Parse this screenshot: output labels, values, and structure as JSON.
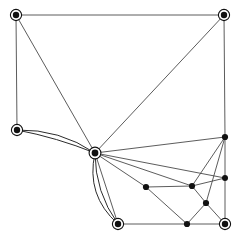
{
  "figure": {
    "kind": "graph-drawing",
    "title": "",
    "background_color": "#ffffff",
    "width": 240,
    "height": 238
  },
  "style": {
    "edge_color": "#4a4a4a",
    "curved_edge_color": "#2b2b2b",
    "node_fill": "#111111",
    "node_ring_stroke": "#111111",
    "node_ring_fill": "#ffffff",
    "edge_width": 0.9,
    "curved_edge_width": 1.0
  },
  "chart_data": {
    "type": "scatter",
    "title": "",
    "xlabel": "",
    "ylabel": "",
    "xlim": [
      0,
      240
    ],
    "ylim": [
      0,
      238
    ],
    "grid": false,
    "legend": "none",
    "nodes": [
      {
        "id": "n0",
        "label": "",
        "x": 16,
        "y": 15,
        "marker": "ringed",
        "radius": 3.2,
        "ring_radius": 5.6
      },
      {
        "id": "n1",
        "label": "",
        "x": 224,
        "y": 15,
        "marker": "ringed",
        "radius": 3.2,
        "ring_radius": 5.6
      },
      {
        "id": "n2",
        "label": "",
        "x": 17,
        "y": 130,
        "marker": "ringed",
        "radius": 3.2,
        "ring_radius": 5.6
      },
      {
        "id": "n3",
        "label": "",
        "x": 95,
        "y": 153,
        "marker": "ringed",
        "radius": 3.4,
        "ring_radius": 5.9
      },
      {
        "id": "n4",
        "label": "",
        "x": 225,
        "y": 137,
        "marker": "plain",
        "radius": 3.1,
        "ring_radius": 0
      },
      {
        "id": "n5",
        "label": "",
        "x": 225,
        "y": 178,
        "marker": "plain",
        "radius": 3.0,
        "ring_radius": 0
      },
      {
        "id": "n6",
        "label": "",
        "x": 146,
        "y": 187,
        "marker": "plain",
        "radius": 3.1,
        "ring_radius": 0
      },
      {
        "id": "n7",
        "label": "",
        "x": 192,
        "y": 186,
        "marker": "plain",
        "radius": 3.1,
        "ring_radius": 0
      },
      {
        "id": "n8",
        "label": "",
        "x": 206,
        "y": 203,
        "marker": "plain",
        "radius": 3.1,
        "ring_radius": 0
      },
      {
        "id": "n9",
        "label": "",
        "x": 118,
        "y": 224,
        "marker": "ringed",
        "radius": 3.2,
        "ring_radius": 5.6
      },
      {
        "id": "n10",
        "label": "",
        "x": 187,
        "y": 224,
        "marker": "plain",
        "radius": 3.1,
        "ring_radius": 0
      },
      {
        "id": "n11",
        "label": "",
        "x": 225,
        "y": 224,
        "marker": "ringed",
        "radius": 3.2,
        "ring_radius": 5.6
      }
    ],
    "edges": [
      {
        "from": "n0",
        "to": "n1",
        "curved": false,
        "bulge": 0
      },
      {
        "from": "n0",
        "to": "n2",
        "curved": false,
        "bulge": 0
      },
      {
        "from": "n0",
        "to": "n3",
        "curved": false,
        "bulge": 0
      },
      {
        "from": "n1",
        "to": "n3",
        "curved": false,
        "bulge": 0
      },
      {
        "from": "n1",
        "to": "n4",
        "curved": false,
        "bulge": 0
      },
      {
        "from": "n2",
        "to": "n3",
        "curved": true,
        "bulge": -13
      },
      {
        "from": "n2",
        "to": "n3",
        "curved": true,
        "bulge": -4
      },
      {
        "from": "n3",
        "to": "n4",
        "curved": false,
        "bulge": 0
      },
      {
        "from": "n3",
        "to": "n5",
        "curved": false,
        "bulge": 0
      },
      {
        "from": "n3",
        "to": "n6",
        "curved": false,
        "bulge": 0
      },
      {
        "from": "n3",
        "to": "n7",
        "curved": false,
        "bulge": 0
      },
      {
        "from": "n3",
        "to": "n9",
        "curved": false,
        "bulge": 0
      },
      {
        "from": "n3",
        "to": "n9",
        "curved": true,
        "bulge": 12
      },
      {
        "from": "n3",
        "to": "n9",
        "curved": true,
        "bulge": 22
      },
      {
        "from": "n4",
        "to": "n5",
        "curved": false,
        "bulge": 0
      },
      {
        "from": "n4",
        "to": "n7",
        "curved": false,
        "bulge": 0
      },
      {
        "from": "n4",
        "to": "n8",
        "curved": false,
        "bulge": 0
      },
      {
        "from": "n5",
        "to": "n7",
        "curved": false,
        "bulge": 0
      },
      {
        "from": "n5",
        "to": "n11",
        "curved": false,
        "bulge": 0
      },
      {
        "from": "n6",
        "to": "n7",
        "curved": false,
        "bulge": 0
      },
      {
        "from": "n6",
        "to": "n10",
        "curved": false,
        "bulge": 0
      },
      {
        "from": "n7",
        "to": "n8",
        "curved": false,
        "bulge": 0
      },
      {
        "from": "n8",
        "to": "n10",
        "curved": false,
        "bulge": 0
      },
      {
        "from": "n8",
        "to": "n11",
        "curved": false,
        "bulge": 0
      },
      {
        "from": "n9",
        "to": "n10",
        "curved": false,
        "bulge": 0
      },
      {
        "from": "n10",
        "to": "n11",
        "curved": false,
        "bulge": 0
      }
    ]
  }
}
